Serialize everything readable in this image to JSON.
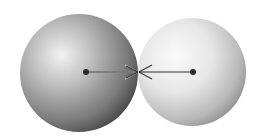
{
  "diagram": {
    "type": "two-sphere-force-diagram",
    "spheres": [
      {
        "name": "left-sphere",
        "cx": 79,
        "cy": 73,
        "r": 59,
        "shade": "dark",
        "center_dot": {
          "x": 86,
          "y": 72
        }
      },
      {
        "name": "right-sphere",
        "cx": 192,
        "cy": 72,
        "r": 54,
        "shade": "light",
        "center_dot": {
          "x": 193,
          "y": 72
        }
      }
    ],
    "arrows": [
      {
        "name": "force-on-left",
        "from": [
          86,
          72
        ],
        "to": [
          138,
          72
        ],
        "direction": "right"
      },
      {
        "name": "force-on-right",
        "from": [
          193,
          72
        ],
        "to": [
          139,
          72
        ],
        "direction": "left"
      }
    ],
    "colors": {
      "background": "#ffffff",
      "line": "#333333",
      "dot": "#2a2a2a"
    }
  }
}
